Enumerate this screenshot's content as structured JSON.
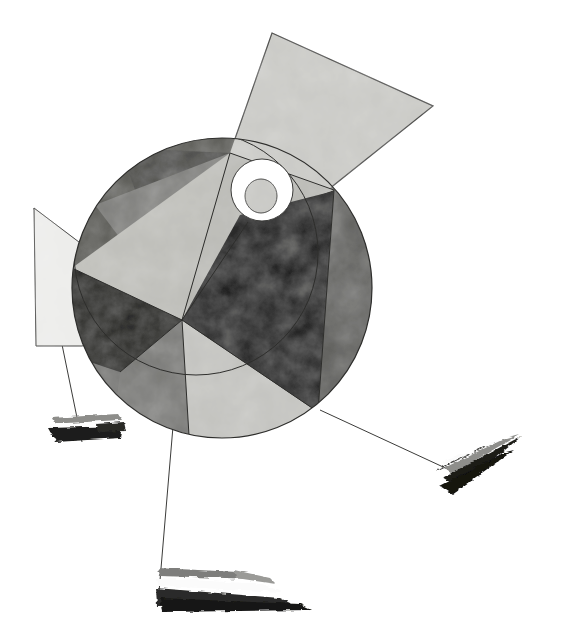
{
  "artwork": {
    "title": "Abstract Geometric Composition",
    "style": "Suprematist / Constructivist abstraction",
    "medium": "Gouache and ink on paper (grayscale reproduction)",
    "canvas": {
      "width": 564,
      "height": 643,
      "background": "#ffffff"
    },
    "palette": {
      "paper_white": "#ffffff",
      "near_white": "#f2f2f0",
      "light_gray": "#cfcfcb",
      "pale_gray": "#c3c3bf",
      "mid_gray": "#9c9c98",
      "dark_gray": "#6f6f6c",
      "darker_gray": "#585856",
      "charcoal": "#3a3a38",
      "black": "#121211",
      "ink_line": "#2a2a28"
    },
    "elements": [
      {
        "name": "main-disc",
        "label": "Segmented circle",
        "shape": "circle",
        "center": [
          222,
          288
        ],
        "radius": 150,
        "description": "Large disc divided into pinwheel wedges radiating from an off-center pivot"
      },
      {
        "name": "overlap-disc",
        "label": "Upper-left overlapping circle",
        "shape": "circle",
        "center": [
          196,
          253
        ],
        "radius": 122,
        "description": "Second circle overlapping the main disc, creating a crescent of darker tone"
      },
      {
        "name": "pivot-point",
        "label": "Central pivot",
        "shape": "point",
        "position": [
          182,
          320
        ]
      },
      {
        "name": "upper-node",
        "label": "Upper node",
        "shape": "point",
        "position": [
          230,
          153
        ]
      },
      {
        "name": "top-right-wedge",
        "label": "Top-right quadrilateral",
        "shape": "quadrilateral",
        "fill": "light_gray",
        "points": "272,33 432,105 328,188 230,153"
      },
      {
        "name": "left-wedge",
        "label": "Left quadrilateral",
        "shape": "quadrilateral",
        "fill": "near_white",
        "points": "34,208 182,320 80,345 35,345"
      },
      {
        "name": "eye-circle",
        "label": "White eye disc",
        "shape": "circle",
        "center": [
          262,
          190
        ],
        "radius": 31,
        "fill": "paper_white"
      },
      {
        "name": "eye-pupil",
        "label": "Inner pupil circle",
        "shape": "circle",
        "center": [
          261,
          195
        ],
        "radius": 15,
        "fill": "light_gray"
      },
      {
        "name": "brush-mark-left",
        "label": "Left brush stroke",
        "position": [
          45,
          412
        ],
        "size": [
          80,
          32
        ]
      },
      {
        "name": "brush-mark-bottom",
        "label": "Bottom brush stroke",
        "position": [
          150,
          556
        ],
        "size": [
          115,
          52
        ]
      },
      {
        "name": "brush-mark-right",
        "label": "Right brush stroke",
        "position": [
          437,
          432
        ],
        "size": [
          82,
          62
        ]
      },
      {
        "name": "thread-left",
        "label": "Thin ink line to left brush",
        "from": [
          34,
          208
        ],
        "to": [
          80,
          438
        ]
      },
      {
        "name": "thread-bottom",
        "label": "Thin ink line to bottom brush",
        "from": [
          182,
          320
        ],
        "to": [
          160,
          600
        ]
      },
      {
        "name": "thread-right",
        "label": "Thin ink line to right brush",
        "from": [
          320,
          410
        ],
        "to": [
          452,
          470
        ]
      }
    ],
    "wedges": [
      {
        "name": "wedge-dark-upper-left",
        "tone": "charcoal",
        "note": "upper-left crescent sector"
      },
      {
        "name": "wedge-gray-upper",
        "tone": "mid_gray",
        "note": "upper sector between arc and radius"
      },
      {
        "name": "wedge-pale-upper",
        "tone": "pale_gray",
        "note": "pale sector left of upper node"
      },
      {
        "name": "wedge-black-left",
        "tone": "black",
        "note": "black triangle pointing left"
      },
      {
        "name": "wedge-black-right",
        "tone": "black",
        "note": "large black triangle pointing right"
      },
      {
        "name": "wedge-gray-lower-left",
        "tone": "dark_gray",
        "note": "lower-left gray sector"
      },
      {
        "name": "wedge-pale-lower",
        "tone": "pale_gray",
        "note": "lower pale sector"
      },
      {
        "name": "wedge-gray-right",
        "tone": "darker_gray",
        "note": "right gray sector of disc"
      }
    ]
  }
}
